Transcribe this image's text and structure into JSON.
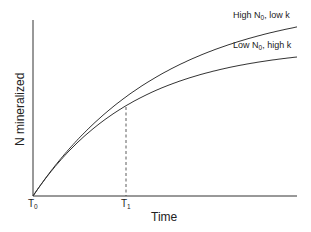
{
  "chart_data": {
    "type": "line",
    "title": "",
    "xlabel": "Time",
    "ylabel": "N mineralized",
    "x_ticks": [
      {
        "main": "T",
        "sub": "0"
      },
      {
        "main": "T",
        "sub": "1"
      }
    ],
    "series": [
      {
        "name": "High N0, low k",
        "label_main": "High N",
        "label_sub": "0",
        "label_rest": ", low k",
        "N0": 195,
        "k": 0.00764
      },
      {
        "name": "Low N0, high k",
        "label_main": "Low N",
        "label_sub": "0",
        "label_rest": ", high k",
        "N0": 150,
        "k": 0.0099
      }
    ],
    "annotations": [
      "dashed vertical line at T1 where curves diverge"
    ],
    "model": "N = N0 * (1 - exp(-k t))",
    "grid": false,
    "legend": "inline labels at curve ends"
  },
  "colors": {
    "line": "#333333",
    "axis": "#333333",
    "background": "#ffffff"
  }
}
